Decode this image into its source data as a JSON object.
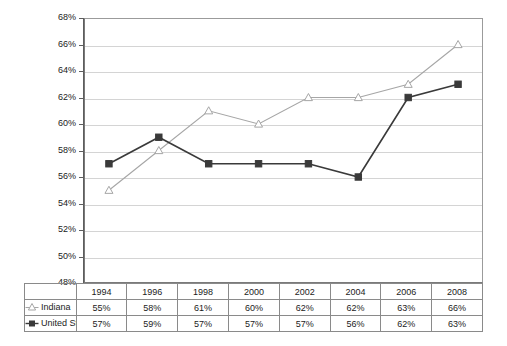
{
  "chart_data": {
    "type": "line",
    "title": "",
    "subtitle": "",
    "xlabel": "",
    "ylabel": "",
    "categories": [
      "1994",
      "1996",
      "1998",
      "2000",
      "2002",
      "2004",
      "2006",
      "2008"
    ],
    "series": [
      {
        "name": "Indiana",
        "marker": "open-triangle",
        "color": "#a6a6a6",
        "values": [
          55,
          58,
          61,
          60,
          62,
          62,
          63,
          66
        ],
        "labels": [
          "55%",
          "58%",
          "61%",
          "60%",
          "62%",
          "62%",
          "63%",
          "66%"
        ]
      },
      {
        "name": "United States",
        "marker": "filled-square",
        "color": "#3a3a3a",
        "values": [
          57,
          59,
          57,
          57,
          57,
          56,
          62,
          63
        ],
        "labels": [
          "57%",
          "59%",
          "57%",
          "57%",
          "57%",
          "56%",
          "62%",
          "63%"
        ]
      }
    ],
    "ylim": [
      48,
      68
    ],
    "ytick_step": 2,
    "ytick_labels": [
      "48%",
      "50%",
      "52%",
      "54%",
      "56%",
      "58%",
      "60%",
      "62%",
      "64%",
      "66%",
      "68%"
    ],
    "grid": "horizontal",
    "legend_position": "bottom-table",
    "gridline_color": "#d4d4d4",
    "axis_color": "#5d5d5d"
  },
  "axis": {
    "y_labels": [
      "68%",
      "66%",
      "64%",
      "62%",
      "60%",
      "58%",
      "56%",
      "54%",
      "52%",
      "50%",
      "48%"
    ]
  },
  "table": {
    "header": [
      "1994",
      "1996",
      "1998",
      "2000",
      "2002",
      "2004",
      "2006",
      "2008"
    ],
    "rows": [
      {
        "label": "Indiana",
        "marker": "open-triangle",
        "cells": [
          "55%",
          "58%",
          "61%",
          "60%",
          "62%",
          "62%",
          "63%",
          "66%"
        ]
      },
      {
        "label": "United States",
        "marker": "filled-square",
        "cells": [
          "57%",
          "59%",
          "57%",
          "57%",
          "57%",
          "56%",
          "62%",
          "63%"
        ]
      }
    ]
  }
}
